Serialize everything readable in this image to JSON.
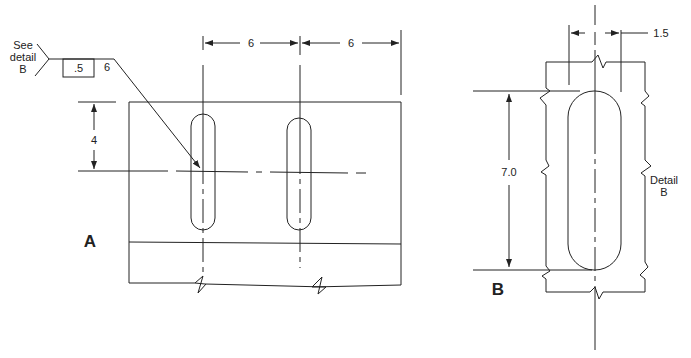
{
  "view_a": {
    "label": "A",
    "dim_spacing_1": "6",
    "dim_spacing_2": "6",
    "dim_vertical": "4",
    "callout": {
      "note_line1": "See",
      "note_line2": "detail",
      "note_line3": "B",
      "box_value": ".5",
      "length_value": "6"
    }
  },
  "view_b": {
    "label": "B",
    "dim_width": "1.5",
    "dim_length": "7.0",
    "caption_line1": "Detail",
    "caption_line2": "B"
  }
}
